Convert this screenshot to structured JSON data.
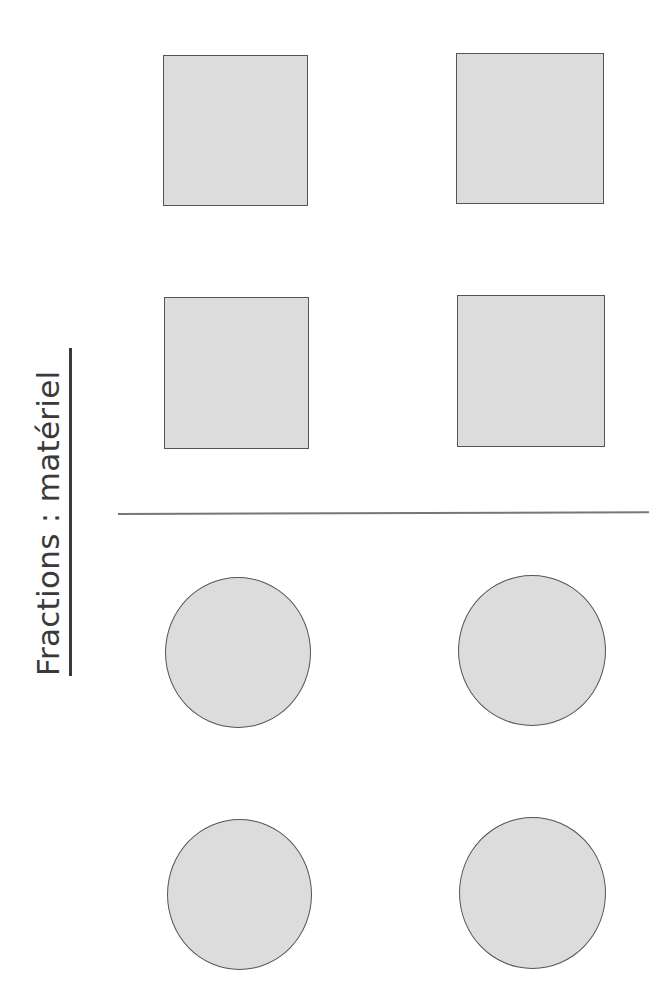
{
  "page": {
    "title": "Fractions : matériel",
    "orientation": "rotated-90-ccw"
  },
  "squares": [
    {
      "id": "square-1",
      "x": 163,
      "y": 55,
      "w": 145,
      "h": 151,
      "fill": "#dcdcdc",
      "stroke": "#555555"
    },
    {
      "id": "square-2",
      "x": 456,
      "y": 53,
      "w": 148,
      "h": 151,
      "fill": "#dcdcdc",
      "stroke": "#555555"
    },
    {
      "id": "square-3",
      "x": 164,
      "y": 297,
      "w": 145,
      "h": 152,
      "fill": "#dcdcdc",
      "stroke": "#555555"
    },
    {
      "id": "square-4",
      "x": 457,
      "y": 295,
      "w": 148,
      "h": 152,
      "fill": "#dcdcdc",
      "stroke": "#555555"
    }
  ],
  "circles": [
    {
      "id": "circle-1",
      "x": 165,
      "y": 577,
      "w": 146,
      "h": 151,
      "fill": "#dcdcdc",
      "stroke": "#555555"
    },
    {
      "id": "circle-2",
      "x": 458,
      "y": 575,
      "w": 148,
      "h": 151,
      "fill": "#dcdcdc",
      "stroke": "#555555"
    },
    {
      "id": "circle-3",
      "x": 167,
      "y": 819,
      "w": 145,
      "h": 151,
      "fill": "#dcdcdc",
      "stroke": "#555555"
    },
    {
      "id": "circle-4",
      "x": 459,
      "y": 817,
      "w": 147,
      "h": 152,
      "fill": "#dcdcdc",
      "stroke": "#555555"
    }
  ],
  "colors": {
    "text": "#3a3a3a",
    "shape_fill": "#dcdcdc",
    "shape_stroke": "#555555",
    "divider": "#777777",
    "background": "#ffffff"
  }
}
